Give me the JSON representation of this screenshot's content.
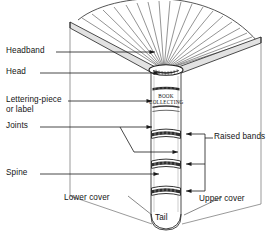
{
  "figure": {
    "kind": "book-anatomy-diagram",
    "ink_color": "#1a1a1a",
    "paper_color": "#ffffff"
  },
  "labels": {
    "headband": "Headband",
    "head": "Head",
    "lettering_piece_line1": "Lettering-piece",
    "lettering_piece_line2": "or label",
    "joints": "Joints",
    "spine": "Spine",
    "raised_bands": "Raised bands",
    "lower_cover": "Lower cover",
    "upper_cover": "Upper cover",
    "tail": "Tail"
  },
  "spine_label": {
    "line1": "BOOK",
    "line2": "COLLECTING"
  },
  "counts": {
    "raised_bands": 3,
    "fanned_leaves": 19
  }
}
